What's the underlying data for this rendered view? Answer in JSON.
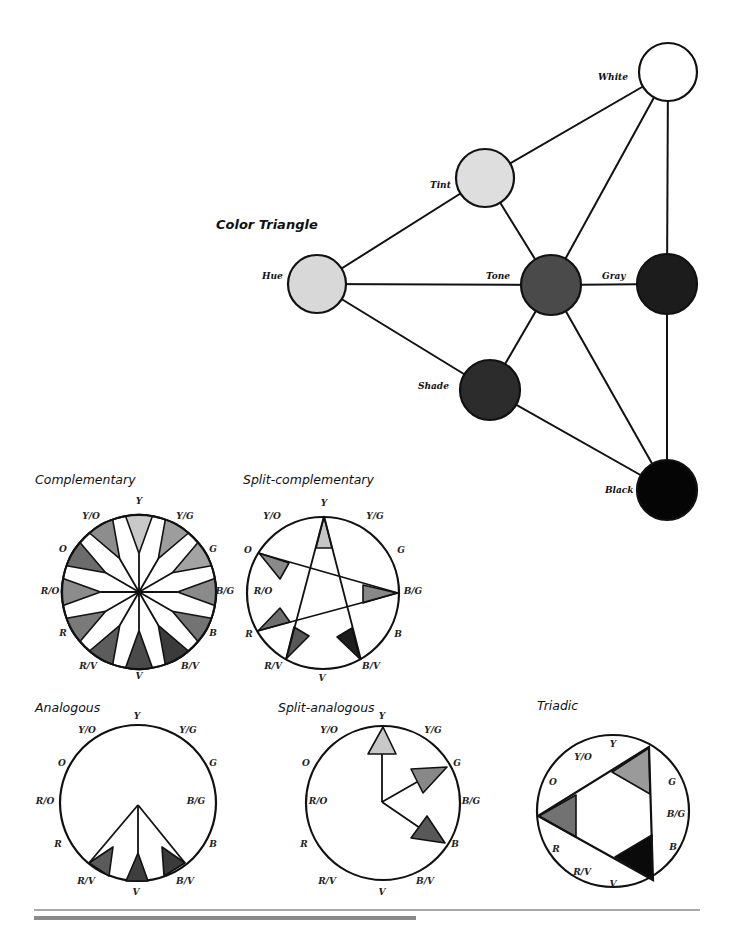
{
  "color_triangle": {
    "title": "Color Triangle",
    "nodes": [
      {
        "id": "white",
        "label": "White",
        "x": 668,
        "y": 72,
        "r": 29,
        "fill": "#ffffff",
        "lx": 598,
        "ly": 80
      },
      {
        "id": "tint",
        "label": "Tint",
        "x": 485,
        "y": 178,
        "r": 29,
        "fill": "#dedede",
        "lx": 430,
        "ly": 188
      },
      {
        "id": "hue",
        "label": "Hue",
        "x": 317,
        "y": 284,
        "r": 29,
        "fill": "#d8d8d8",
        "lx": 262,
        "ly": 279
      },
      {
        "id": "tone",
        "label": "Tone",
        "x": 551,
        "y": 285,
        "r": 30,
        "fill": "#4a4a4a",
        "lx": 486,
        "ly": 279
      },
      {
        "id": "gray",
        "label": "Gray",
        "x": 667,
        "y": 284,
        "r": 30,
        "fill": "#1c1c1c",
        "lx": 602,
        "ly": 279
      },
      {
        "id": "shade",
        "label": "Shade",
        "x": 490,
        "y": 390,
        "r": 30,
        "fill": "#2c2c2c",
        "lx": 418,
        "ly": 389
      },
      {
        "id": "black",
        "label": "Black",
        "x": 667,
        "y": 490,
        "r": 30,
        "fill": "#050505",
        "lx": 605,
        "ly": 493
      }
    ],
    "edges": [
      [
        "hue",
        "tint"
      ],
      [
        "tint",
        "white"
      ],
      [
        "hue",
        "tone"
      ],
      [
        "tone",
        "gray"
      ],
      [
        "hue",
        "shade"
      ],
      [
        "tint",
        "tone"
      ],
      [
        "tone",
        "shade"
      ],
      [
        "white",
        "tone"
      ],
      [
        "white",
        "gray"
      ],
      [
        "gray",
        "black"
      ],
      [
        "shade",
        "black"
      ],
      [
        "tone",
        "black"
      ]
    ]
  },
  "wheels": {
    "hue_names": [
      "Y",
      "Y/G",
      "G",
      "B/G",
      "B",
      "B/V",
      "V",
      "R/V",
      "R",
      "R/O",
      "O",
      "Y/O"
    ],
    "complementary": {
      "title": "Complementary",
      "title_pos": [
        35,
        484
      ],
      "cx": 139,
      "cy": 592,
      "r": 77,
      "label_positions": [
        [
          139,
          504
        ],
        [
          185,
          519
        ],
        [
          213,
          552
        ],
        [
          225,
          594
        ],
        [
          213,
          636
        ],
        [
          190,
          669
        ],
        [
          139,
          679
        ],
        [
          88,
          669
        ],
        [
          63,
          636
        ],
        [
          50,
          594
        ],
        [
          63,
          552
        ],
        [
          91,
          519
        ]
      ],
      "wedge_fills": [
        "#c9c9c9",
        "#9d9d9d",
        "#a3a3a3",
        "#8a8a8a",
        "#737373",
        "#3b3b3b",
        "#4a4a4a",
        "#5c5c5c",
        "#7a7a7a",
        "#8c8c8c",
        "#6c6c6c",
        "#8d8d8d"
      ]
    },
    "split_complementary": {
      "title": "Split-complementary",
      "title_pos": [
        243,
        484
      ],
      "cx": 323,
      "cy": 593,
      "r": 76,
      "label_positions": [
        [
          324,
          506
        ],
        [
          375,
          519
        ],
        [
          401,
          553
        ],
        [
          413,
          594
        ],
        [
          398,
          637
        ],
        [
          371,
          669
        ],
        [
          322,
          681
        ],
        [
          273,
          669
        ],
        [
          249,
          637
        ],
        [
          263,
          594
        ],
        [
          248,
          553
        ],
        [
          272,
          519
        ]
      ],
      "lines": [
        [
          [
            324,
            516
          ],
          [
            286,
            660
          ]
        ],
        [
          [
            324,
            516
          ],
          [
            361,
            660
          ]
        ],
        [
          [
            258,
            553
          ],
          [
            398,
            593
          ]
        ],
        [
          [
            257,
            631
          ],
          [
            398,
            593
          ]
        ]
      ],
      "shapes": [
        {
          "name": "Y",
          "fill": "#c6c6c6",
          "points": [
            [
              324,
              517
            ],
            [
              316,
              548
            ],
            [
              332,
              548
            ]
          ]
        },
        {
          "name": "O",
          "fill": "#8a8a8a",
          "points": [
            [
              259,
              553
            ],
            [
              289,
              563
            ],
            [
              280,
              579
            ]
          ]
        },
        {
          "name": "B/G",
          "fill": "#888888",
          "points": [
            [
              397,
              593
            ],
            [
              363,
              585
            ],
            [
              363,
              603
            ]
          ]
        },
        {
          "name": "R",
          "fill": "#6e6e6e",
          "points": [
            [
              258,
              631
            ],
            [
              280,
              608
            ],
            [
              290,
              622
            ]
          ]
        },
        {
          "name": "R/V",
          "fill": "#585858",
          "points": [
            [
              286,
              659
            ],
            [
              294,
              627
            ],
            [
              309,
              636
            ]
          ]
        },
        {
          "name": "B/V",
          "fill": "#1e1e1e",
          "points": [
            [
              360,
              659
            ],
            [
              337,
              637
            ],
            [
              352,
              628
            ]
          ]
        }
      ]
    },
    "analogous": {
      "title": "Analogous",
      "title_pos": [
        35,
        712
      ],
      "cx": 138,
      "cy": 803,
      "r": 78,
      "label_positions": [
        [
          137,
          719
        ],
        [
          87,
          733
        ],
        [
          188,
          733
        ],
        [
          62,
          766
        ],
        [
          213,
          766
        ],
        [
          45,
          804
        ],
        [
          196,
          804
        ],
        [
          58,
          847
        ],
        [
          213,
          847
        ],
        [
          86,
          884
        ],
        [
          185,
          884
        ],
        [
          136,
          895
        ]
      ],
      "label_order": [
        "Y",
        "Y/O",
        "Y/G",
        "O",
        "G",
        "R/O",
        "B/G",
        "R",
        "B",
        "R/V",
        "B/V",
        "V"
      ],
      "lines": [
        [
          [
            138,
            805
          ],
          [
            89,
            863
          ]
        ],
        [
          [
            138,
            805
          ],
          [
            185,
            863
          ]
        ],
        [
          [
            138,
            805
          ],
          [
            138,
            853
          ]
        ]
      ],
      "shapes": [
        {
          "name": "R/V",
          "fill": "#5a5a5a",
          "points": [
            [
              89,
              863
            ],
            [
              113,
              847
            ],
            [
              109,
              876
            ]
          ]
        },
        {
          "name": "V",
          "fill": "#3e3e3e",
          "points": [
            [
              138,
              853
            ],
            [
              126,
              881
            ],
            [
              148,
              881
            ]
          ]
        },
        {
          "name": "B/V",
          "fill": "#3a3a3a",
          "points": [
            [
              185,
              863
            ],
            [
              162,
              847
            ],
            [
              164,
              876
            ]
          ]
        }
      ]
    },
    "split_analogous": {
      "title": "Split-analogous",
      "title_pos": [
        278,
        712
      ],
      "cx": 383,
      "cy": 803,
      "r": 77,
      "label_positions": [
        [
          382,
          719
        ],
        [
          329,
          733
        ],
        [
          433,
          733
        ],
        [
          306,
          766
        ],
        [
          457,
          766
        ],
        [
          318,
          804
        ],
        [
          471,
          804
        ],
        [
          304,
          847
        ],
        [
          455,
          847
        ],
        [
          327,
          884
        ],
        [
          425,
          884
        ],
        [
          382,
          895
        ]
      ],
      "label_order": [
        "Y",
        "Y/O",
        "Y/G",
        "O",
        "G",
        "R/O",
        "B/G",
        "R",
        "B",
        "R/V",
        "B/V",
        "V"
      ],
      "lines": [
        [
          [
            382,
            802
          ],
          [
            382,
            754
          ]
        ],
        [
          [
            382,
            802
          ],
          [
            417,
            782
          ]
        ],
        [
          [
            382,
            802
          ],
          [
            420,
            828
          ]
        ]
      ],
      "shapes": [
        {
          "name": "Y",
          "fill": "#c8c8c8",
          "points": [
            [
              383,
              727
            ],
            [
              368,
              754
            ],
            [
              396,
              754
            ]
          ]
        },
        {
          "name": "G",
          "fill": "#888888",
          "points": [
            [
              447,
              767
            ],
            [
              411,
              769
            ],
            [
              423,
              793
            ]
          ]
        },
        {
          "name": "B",
          "fill": "#585858",
          "points": [
            [
              445,
              843
            ],
            [
              411,
              838
            ],
            [
              427,
              816
            ]
          ]
        }
      ]
    },
    "triadic": {
      "title": "Triadic",
      "title_pos": [
        537,
        710
      ],
      "cx": 613,
      "cy": 811,
      "r": 76,
      "label_positions": [
        [
          613,
          747
        ],
        [
          583,
          760
        ],
        [
          553,
          785
        ],
        [
          672,
          785
        ],
        [
          676,
          817
        ],
        [
          673,
          850
        ],
        [
          556,
          852
        ],
        [
          582,
          875
        ],
        [
          613,
          887
        ]
      ],
      "label_order": [
        "Y",
        "Y/O",
        "O",
        "G",
        "B/G",
        "B",
        "R",
        "R/V",
        "V"
      ],
      "triangle": [
        [
          649,
          747
        ],
        [
          538,
          816
        ],
        [
          653,
          880
        ]
      ],
      "shapes": [
        {
          "name": "Y",
          "fill": "#9a9a9a",
          "points": [
            [
              649,
              748
            ],
            [
              612,
              772
            ],
            [
              650,
              794
            ]
          ]
        },
        {
          "name": "R",
          "fill": "#727272",
          "points": [
            [
              539,
              816
            ],
            [
              576,
              795
            ],
            [
              576,
              837
            ]
          ]
        },
        {
          "name": "B",
          "fill": "#0a0a0a",
          "points": [
            [
              652,
              879
            ],
            [
              615,
              857
            ],
            [
              652,
              835
            ]
          ]
        }
      ]
    }
  },
  "footer": {
    "rule_color": "#555555",
    "bar_color": "#8a8a8a"
  }
}
